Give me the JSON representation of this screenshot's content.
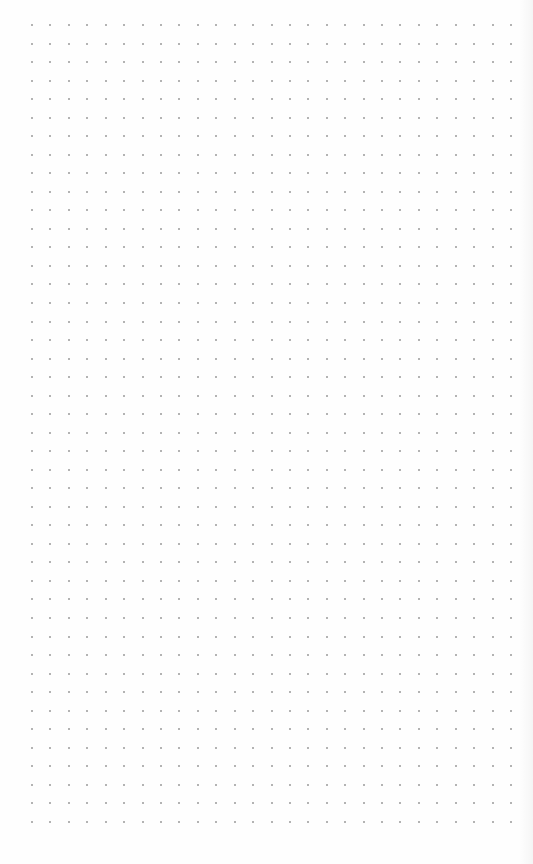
{
  "canvas": {
    "type": "dot-grid",
    "background_color": "#fefefe",
    "dot_color": "#9a9a9a",
    "columns": 27,
    "rows": 44,
    "origin_x": 32,
    "origin_y": 25,
    "spacing_x": 18.42,
    "spacing_y": 18.53
  }
}
